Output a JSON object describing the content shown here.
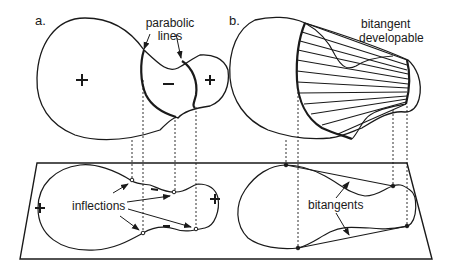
{
  "figure": {
    "panels": [
      {
        "id": "a",
        "label": "a.",
        "annotations": {
          "parabolic_lines": [
            "parabolic",
            "lines"
          ],
          "inflections": "inflections"
        },
        "signs": {
          "large_lobe": "+",
          "middle_region": "–",
          "small_lobe": "+",
          "projection_left": "+",
          "projection_right": "+"
        }
      },
      {
        "id": "b",
        "label": "b.",
        "annotations": {
          "bitangent_developable": [
            "bitangent",
            "developable"
          ],
          "bitangents": "bitangents"
        }
      }
    ],
    "colors": {
      "ink": "#1a1a1a",
      "background": "#ffffff"
    }
  }
}
